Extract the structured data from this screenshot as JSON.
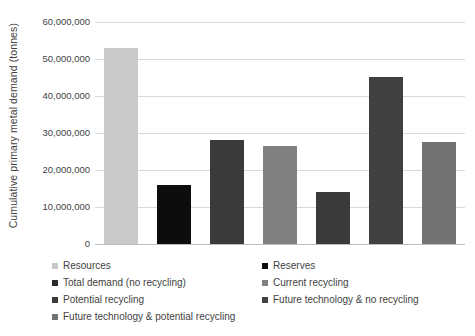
{
  "chart_data": {
    "type": "bar",
    "title": "",
    "subtitle": "",
    "xlabel": "",
    "ylabel": "Cumulative primary metal demand (tonnes)",
    "ylim": [
      0,
      60000000
    ],
    "ytick_values": [
      0,
      10000000,
      20000000,
      30000000,
      40000000,
      50000000,
      60000000
    ],
    "ytick_labels": [
      "0",
      "10,000,000",
      "20,000,000",
      "30,000,000",
      "40,000,000",
      "50,000,000",
      "60,000,000"
    ],
    "xtick_labels": [],
    "grid": "horizontal",
    "legend_position": "bottom",
    "legend_columns": 2,
    "categories": [
      "Resources",
      "Reserves",
      "Total demand (no recycling)",
      "Current recycling",
      "Potential recycling",
      "Future technology & no recycling",
      "Future technology & potential recycling"
    ],
    "values": [
      53000000,
      16000000,
      28000000,
      26500000,
      14000000,
      45000000,
      27700000
    ],
    "colors": [
      "#c9c9c9",
      "#0d0d0d",
      "#3a3a3a",
      "#808080",
      "#3a3a3a",
      "#404040",
      "#737373"
    ]
  },
  "legend": {
    "entries": [
      {
        "label": "Resources",
        "color": "#c9c9c9"
      },
      {
        "label": "Reserves",
        "color": "#0d0d0d"
      },
      {
        "label": "Total demand (no recycling)",
        "color": "#2b2b2b"
      },
      {
        "label": "Current recycling",
        "color": "#808080"
      },
      {
        "label": "Potential recycling",
        "color": "#3a3a3a"
      },
      {
        "label": "Future technology & no recycling",
        "color": "#404040"
      },
      {
        "label": "Future technology & potential recycling",
        "color": "#737373"
      }
    ]
  }
}
